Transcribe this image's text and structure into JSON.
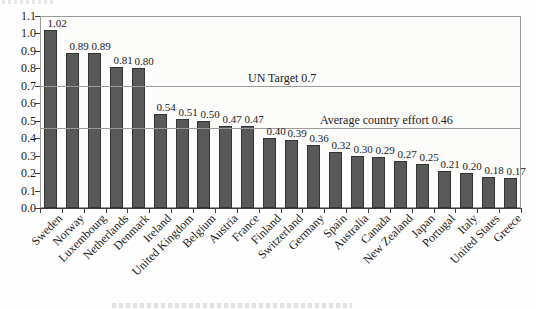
{
  "chart_data": {
    "type": "bar",
    "title": "",
    "xlabel": "",
    "ylabel": "",
    "categories": [
      "Sweden",
      "Norway",
      "Luxembourg",
      "Netherlands",
      "Denmark",
      "Ireland",
      "United Kingdom",
      "Belgium",
      "Austria",
      "France",
      "Finland",
      "Switzerland",
      "Germany",
      "Spain",
      "Australia",
      "Canada",
      "New Zealand",
      "Japan",
      "Portugal",
      "Italy",
      "United States",
      "Greece"
    ],
    "values": [
      1.02,
      0.89,
      0.89,
      0.81,
      0.8,
      0.54,
      0.51,
      0.5,
      0.47,
      0.47,
      0.4,
      0.39,
      0.36,
      0.32,
      0.3,
      0.29,
      0.27,
      0.25,
      0.21,
      0.2,
      0.18,
      0.17
    ],
    "value_labels": [
      "1.02",
      "0.89",
      "0.89",
      "0.81",
      "0.80",
      "0.54",
      "0.51",
      "0.50",
      "0.47",
      "0.47",
      "0.40",
      "0.39",
      "0.36",
      "0.32",
      "0.30",
      "0.29",
      "0.27",
      "0.25",
      "0.21",
      "0.20",
      "0.18",
      "0.17"
    ],
    "ylim": [
      0,
      1.1
    ],
    "ytick_labels": [
      "0.0",
      "0.1",
      "0.2",
      "0.3",
      "0.4",
      "0.5",
      "0.6",
      "0.7",
      "0.8",
      "0.9",
      "1.0",
      "1.1"
    ],
    "grid": "off",
    "legend": "none",
    "xlabel_rotation_deg": -45,
    "reference_lines": [
      {
        "value": 0.7,
        "label": "UN Target 0.7",
        "label_x": 248
      },
      {
        "value": 0.46,
        "label": "Average country effort 0.46",
        "label_x": 320
      }
    ],
    "colors": {
      "bar_fill": "#595959",
      "bar_border": "#343434",
      "reference_line": "#9b9b9b",
      "plot_border": "#9a9a9a",
      "text": "#1b1b1b"
    }
  }
}
